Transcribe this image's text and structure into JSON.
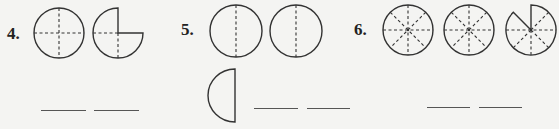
{
  "worksheet": {
    "topic": "fractions of circles",
    "colors": {
      "background": "#f4f4f2",
      "ink": "#333333"
    },
    "problems": [
      {
        "number": "4.",
        "figures": [
          {
            "type": "circle",
            "parts": 4,
            "shaded_or_present": 4,
            "divider": "cross-dashed"
          },
          {
            "type": "circle",
            "parts": 4,
            "shaded_or_present": 3,
            "divider": "cross-dashed",
            "missing": "top-right quarter"
          }
        ],
        "blanks": [
          "",
          ""
        ]
      },
      {
        "number": "5.",
        "figures": [
          {
            "type": "circle",
            "parts": 2,
            "shaded_or_present": 2,
            "divider": "vertical-dashed"
          },
          {
            "type": "circle",
            "parts": 2,
            "shaded_or_present": 2,
            "divider": "vertical-dashed"
          },
          {
            "type": "half-circle",
            "parts": 2,
            "shaded_or_present": 1,
            "missing": "right half"
          }
        ],
        "blanks": [
          "",
          ""
        ]
      },
      {
        "number": "6.",
        "figures": [
          {
            "type": "circle",
            "parts": 8,
            "shaded_or_present": 8,
            "divider": "eighths-dashed"
          },
          {
            "type": "circle",
            "parts": 8,
            "shaded_or_present": 8,
            "divider": "eighths-dashed"
          },
          {
            "type": "circle",
            "parts": 8,
            "shaded_or_present": 7,
            "divider": "eighths-dashed",
            "missing": "top-left-upper eighth"
          }
        ],
        "blanks": [
          "",
          ""
        ]
      }
    ]
  }
}
